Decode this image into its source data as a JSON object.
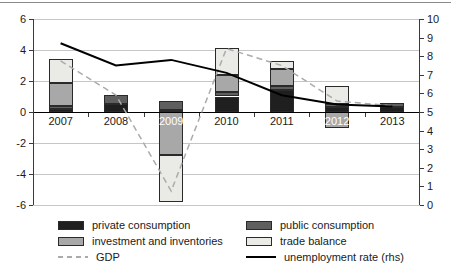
{
  "chart_data": {
    "type": "bar",
    "subtype": "stacked-bars-with-lines",
    "categories": [
      "2007",
      "2008",
      "2009",
      "2010",
      "2011",
      "2012",
      "2013"
    ],
    "series": [
      {
        "name": "private consumption",
        "type": "bar",
        "color": "#1f1f1f",
        "values": [
          0.2,
          0.5,
          0.1,
          1.0,
          1.4,
          0.3,
          0.3
        ]
      },
      {
        "name": "public consumption",
        "type": "bar",
        "color": "#5f5f5f",
        "values": [
          0.2,
          0.6,
          0.6,
          0.3,
          0.3,
          0.2,
          0.3
        ]
      },
      {
        "name": "investment and inventories",
        "type": "bar",
        "color": "#a8a8a8",
        "values": [
          1.5,
          0.0,
          -2.8,
          1.1,
          1.1,
          -1.0,
          0.0
        ]
      },
      {
        "name": "trade balance",
        "type": "bar",
        "color": "#eaeae6",
        "values": [
          1.5,
          0.0,
          -3.0,
          1.7,
          0.5,
          1.2,
          0.0
        ]
      },
      {
        "name": "GDP",
        "type": "line",
        "line_style": "dashed",
        "color": "#ababab",
        "axis": "left",
        "values": [
          3.3,
          1.1,
          -5.1,
          4.1,
          3.0,
          0.7,
          0.4
        ]
      },
      {
        "name": "unemployment rate (rhs)",
        "type": "line",
        "line_style": "solid",
        "color": "#000000",
        "axis": "right",
        "values": [
          8.7,
          7.5,
          7.8,
          7.1,
          5.9,
          5.4,
          5.3
        ]
      }
    ],
    "left_axis": {
      "min": -6,
      "max": 6,
      "ticks": [
        6,
        4,
        2,
        0,
        -2,
        -4,
        -6
      ]
    },
    "right_axis": {
      "min": 0,
      "max": 10,
      "ticks": [
        10,
        9,
        8,
        7,
        6,
        5,
        4,
        3,
        2,
        1,
        0
      ]
    },
    "gridline_values": [
      6,
      4,
      2,
      -2,
      -4,
      -6
    ],
    "labels_on_bars": [
      "2009",
      "2012"
    ],
    "grid_on": true,
    "legend_position": "bottom",
    "colors": {
      "grid": "#c6c6c6",
      "zero_line": "#000000",
      "axis": "#3a3a3a",
      "tick_label": "#1a1a1a"
    }
  },
  "legend": {
    "rows": [
      [
        {
          "series": 0
        },
        {
          "series": 1
        }
      ],
      [
        {
          "series": 2
        },
        {
          "series": 3
        }
      ],
      [
        {
          "series": 4
        },
        {
          "series": 5
        }
      ]
    ]
  }
}
